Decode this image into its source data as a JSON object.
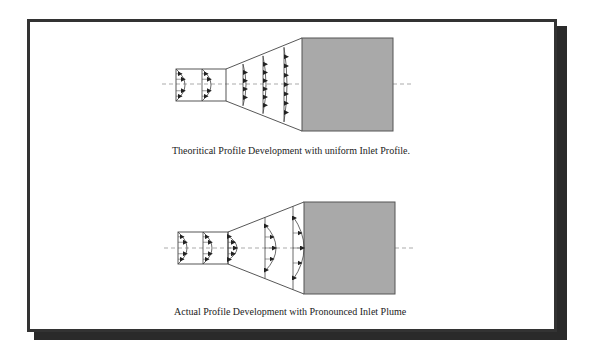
{
  "figure": {
    "colors": {
      "frame": "#333333",
      "shadow": "#2a2a2a",
      "settling_chamber_fill": "#a9a9a9",
      "settling_chamber_stroke": "#555555",
      "line": "#444444",
      "centerline": "#888888"
    },
    "panels": [
      {
        "id": "theoretical",
        "caption": "Theoritical Profile Development with uniform Inlet Profile.",
        "centerline_y": 84,
        "inlet": {
          "x1": 176,
          "x2": 226,
          "y1": 69,
          "y2": 101,
          "divider_x": 202
        },
        "diffuser": {
          "x1": 226,
          "x2": 302,
          "narrow_y1": 69,
          "narrow_y2": 101,
          "wide_y1": 38,
          "wide_y2": 131
        },
        "chamber": {
          "x": 302,
          "y": 38,
          "w": 91,
          "h": 93
        },
        "profile_stations_x": [
          243,
          263,
          284
        ],
        "profile_style": "flat"
      },
      {
        "id": "actual",
        "caption": "Actual Profile Development with Pronounced  Inlet Plume",
        "centerline_y": 248,
        "inlet": {
          "x1": 178,
          "x2": 228,
          "y1": 232,
          "y2": 264,
          "divider_x": 203
        },
        "diffuser": {
          "x1": 228,
          "x2": 304,
          "narrow_y1": 232,
          "narrow_y2": 264,
          "wide_y1": 202,
          "wide_y2": 294
        },
        "chamber": {
          "x": 304,
          "y": 202,
          "w": 91,
          "h": 92
        },
        "profile_stations_x": [
          228,
          265,
          293
        ],
        "profile_style": "peaked"
      }
    ]
  }
}
